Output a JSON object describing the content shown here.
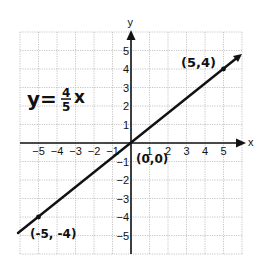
{
  "chart_data": {
    "type": "line",
    "equation": {
      "lhs": "y=",
      "numerator": "4",
      "denominator": "5",
      "var": "x"
    },
    "xlabel": "x",
    "ylabel": "y",
    "xlim": [
      -6,
      6
    ],
    "ylim": [
      -6,
      6
    ],
    "grid": true,
    "x_ticks": [
      "-5",
      "-4",
      "-3",
      "-2",
      "-1",
      "1",
      "2",
      "3",
      "4",
      "5"
    ],
    "y_ticks": [
      "5",
      "4",
      "3",
      "2",
      "1",
      "-1",
      "-2",
      "-3",
      "-4",
      "-5"
    ],
    "series": [
      {
        "name": "y = 4/5 x",
        "x": [
          -5,
          0,
          5
        ],
        "y": [
          -4,
          0,
          4
        ]
      }
    ],
    "annotations": [
      {
        "text": "(5,4)",
        "x": 5,
        "y": 4
      },
      {
        "text": "(0,0)",
        "x": 0,
        "y": 0
      },
      {
        "text": "(-5, -4)",
        "x": -5,
        "y": -4
      }
    ]
  }
}
